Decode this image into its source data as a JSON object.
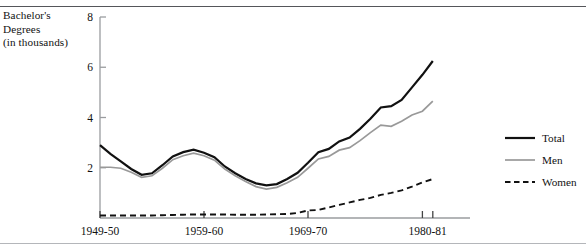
{
  "figure": {
    "y_axis_title": "Bachelor's\nDegrees\n(in thousands)",
    "top_rule": true,
    "bottom_rule": true
  },
  "legend": {
    "position": "right",
    "items": [
      {
        "label": "Total",
        "style": "solid-thick",
        "color": "#111111"
      },
      {
        "label": "Men",
        "style": "solid-thin",
        "color": "#999999"
      },
      {
        "label": "Women",
        "style": "dashed",
        "color": "#111111"
      }
    ]
  },
  "chart_data": {
    "type": "line",
    "title": "",
    "xlabel": "",
    "ylabel": "Bachelor's Degrees (in thousands)",
    "grid": false,
    "legend_position": "right",
    "ylim": [
      0,
      8
    ],
    "ytick_values": [
      2,
      4,
      6,
      8
    ],
    "ytick_labels": [
      "2",
      "4",
      "6",
      "8"
    ],
    "xlim": [
      1949,
      1981
    ],
    "xtick_values": [
      1949,
      1959,
      1969,
      1980,
      1981
    ],
    "xtick_labels": [
      "1949-50",
      "1959-60",
      "1969-70",
      "1980-81"
    ],
    "x_major_ticks": [
      1949,
      1959,
      1969
    ],
    "x_minor_ticks": [
      1980,
      1981
    ],
    "x": [
      1949,
      1950,
      1951,
      1952,
      1953,
      1954,
      1955,
      1956,
      1957,
      1958,
      1959,
      1960,
      1961,
      1962,
      1963,
      1964,
      1965,
      1966,
      1967,
      1968,
      1969,
      1970,
      1971,
      1972,
      1973,
      1974,
      1975,
      1976,
      1977,
      1978,
      1979,
      1980,
      1981
    ],
    "series": [
      {
        "name": "Total",
        "color": "#111111",
        "style": "solid-thick",
        "values": [
          2.9,
          2.55,
          2.25,
          1.95,
          1.72,
          1.78,
          2.1,
          2.45,
          2.62,
          2.72,
          2.6,
          2.42,
          2.05,
          1.78,
          1.55,
          1.38,
          1.3,
          1.35,
          1.55,
          1.8,
          2.2,
          2.62,
          2.75,
          3.05,
          3.2,
          3.55,
          3.95,
          4.4,
          4.45,
          4.7,
          5.2,
          5.7,
          6.25
        ]
      },
      {
        "name": "Men",
        "color": "#999999",
        "style": "solid-thin",
        "values": [
          2.02,
          2.02,
          1.98,
          1.82,
          1.62,
          1.68,
          1.98,
          2.32,
          2.48,
          2.58,
          2.48,
          2.3,
          1.95,
          1.68,
          1.45,
          1.25,
          1.15,
          1.22,
          1.4,
          1.62,
          1.98,
          2.35,
          2.45,
          2.7,
          2.8,
          3.08,
          3.4,
          3.7,
          3.65,
          3.85,
          4.1,
          4.25,
          4.65
        ]
      },
      {
        "name": "Women",
        "color": "#111111",
        "style": "dashed",
        "values": [
          0.1,
          0.1,
          0.1,
          0.1,
          0.1,
          0.1,
          0.11,
          0.12,
          0.13,
          0.14,
          0.14,
          0.14,
          0.14,
          0.13,
          0.13,
          0.13,
          0.14,
          0.15,
          0.16,
          0.2,
          0.3,
          0.32,
          0.42,
          0.52,
          0.62,
          0.72,
          0.8,
          0.92,
          1.0,
          1.1,
          1.25,
          1.42,
          1.55
        ]
      }
    ]
  },
  "geometry": {
    "plot_left": 100,
    "plot_right": 470,
    "plot_baseline_y": 218,
    "plot_top_y": 17,
    "px_per_year": 10.4,
    "legend_x": 505
  }
}
